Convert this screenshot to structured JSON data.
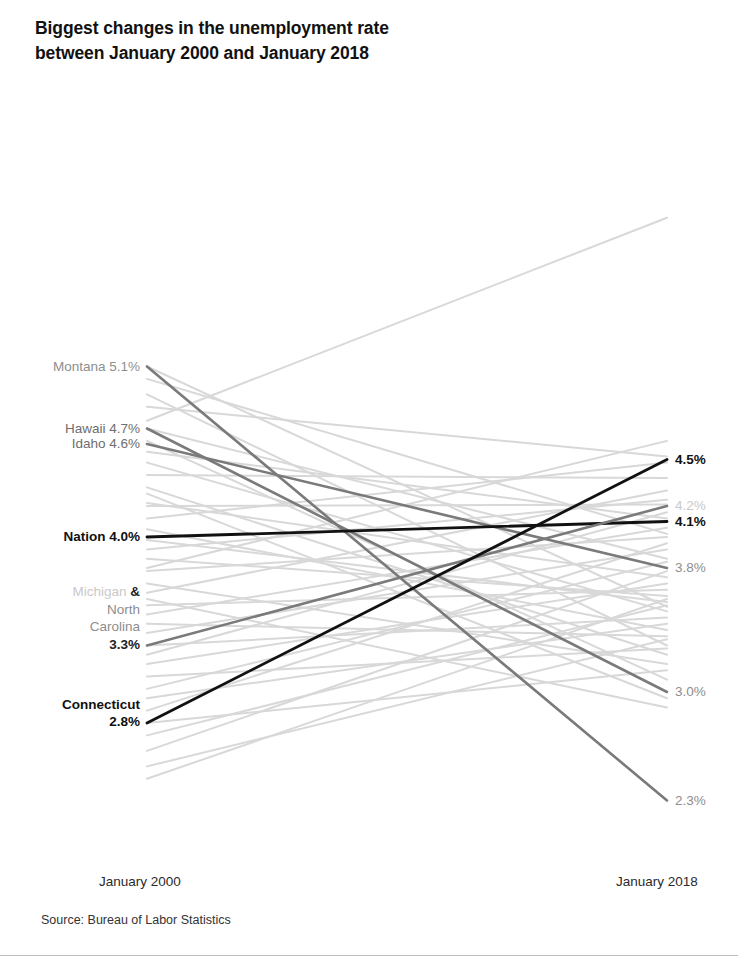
{
  "title": "Biggest changes in the unemployment rate between January 2000 and January 2018",
  "title_line1": "Biggest changes in the unemployment rate",
  "title_line2": "between January 2000 and January 2018",
  "source": "Source: Bureau of Labor Statistics",
  "axis": {
    "left_label": "January 2000",
    "right_label": "January 2018"
  },
  "colors": {
    "background_line": "#d8d8d8",
    "highlight_line": "#7a7a7a",
    "emphasis_line": "#111111",
    "muted_text": "#8e8e8e",
    "faint_text": "#c9c9c9",
    "strong_text": "#111111",
    "rule": "#bdbdbd",
    "page_background": "#ffffff"
  },
  "chart_data": {
    "type": "line",
    "subtype": "slopegraph",
    "title": "Biggest changes in the unemployment rate between January 2000 and January 2018",
    "xlabel": "",
    "ylabel": "Unemployment rate",
    "x": [
      "January 2000",
      "January 2018"
    ],
    "ylim": [
      2.0,
      6.5
    ],
    "grid": false,
    "legend": "none",
    "value_format": "percent",
    "highlighted_series": [
      {
        "name": "Montana",
        "left_label": "Montana 5.1%",
        "right_label": "2.3%",
        "values": [
          5.1,
          2.3
        ],
        "emphasis": "highlight",
        "left_label_style": "mute",
        "right_label_style": "mute"
      },
      {
        "name": "Hawaii",
        "left_label": "Hawaii 4.7%",
        "right_label": "3.0%",
        "values": [
          4.7,
          3.0
        ],
        "emphasis": "highlight",
        "left_label_style": "mid",
        "right_label_style": "mute"
      },
      {
        "name": "Idaho",
        "left_label": "Idaho 4.6%",
        "right_label": "3.8%",
        "values": [
          4.6,
          3.8
        ],
        "emphasis": "highlight",
        "left_label_style": "mid",
        "right_label_style": "mute"
      },
      {
        "name": "Nation",
        "left_label": "Nation 4.0%",
        "right_label": "4.1%",
        "values": [
          4.0,
          4.1
        ],
        "emphasis": "emphasis",
        "left_label_style": "strong",
        "right_label_style": "strong"
      },
      {
        "name": "Michigan & North Carolina",
        "left_label_lines": [
          "Michigan &",
          "North",
          "Carolina",
          "3.3%"
        ],
        "right_label": "4.2%",
        "values": [
          3.3,
          4.2
        ],
        "emphasis": "highlight",
        "left_label_style": "mixed",
        "right_label_style": "faint"
      },
      {
        "name": "Connecticut",
        "left_label_lines": [
          "Connecticut",
          "2.8%"
        ],
        "right_label": "4.5%",
        "values": [
          2.8,
          4.5
        ],
        "emphasis": "emphasis",
        "left_label_style": "strong",
        "right_label_style": "strong"
      }
    ],
    "background_series": [
      {
        "name": "bg-01",
        "values": [
          4.75,
          6.06
        ]
      },
      {
        "name": "bg-02",
        "values": [
          4.2,
          4.21
        ]
      },
      {
        "name": "bg-03",
        "values": [
          3.98,
          3.58
        ]
      },
      {
        "name": "bg-04",
        "values": [
          3.8,
          4.62
        ]
      },
      {
        "name": "bg-05",
        "values": [
          5.1,
          3.55
        ]
      },
      {
        "name": "bg-06",
        "values": [
          5.02,
          4.02
        ]
      },
      {
        "name": "bg-07",
        "values": [
          4.92,
          3.3
        ]
      },
      {
        "name": "bg-08",
        "values": [
          4.7,
          3.86
        ]
      },
      {
        "name": "bg-09",
        "values": [
          4.62,
          3.08
        ]
      },
      {
        "name": "bg-10",
        "values": [
          4.55,
          4.12
        ]
      },
      {
        "name": "bg-11",
        "values": [
          4.48,
          3.52
        ]
      },
      {
        "name": "bg-12",
        "values": [
          4.4,
          4.38
        ]
      },
      {
        "name": "bg-13",
        "values": [
          4.32,
          3.24
        ]
      },
      {
        "name": "bg-14",
        "values": [
          4.22,
          3.74
        ]
      },
      {
        "name": "bg-15",
        "values": [
          4.12,
          4.48
        ]
      },
      {
        "name": "bg-16",
        "values": [
          4.05,
          3.4
        ]
      },
      {
        "name": "bg-17",
        "values": [
          3.92,
          4.24
        ]
      },
      {
        "name": "bg-18",
        "values": [
          3.86,
          3.62
        ]
      },
      {
        "name": "bg-19",
        "values": [
          3.78,
          4.0
        ]
      },
      {
        "name": "bg-20",
        "values": [
          3.7,
          3.18
        ]
      },
      {
        "name": "bg-21",
        "values": [
          3.64,
          4.3
        ]
      },
      {
        "name": "bg-22",
        "values": [
          3.56,
          3.66
        ]
      },
      {
        "name": "bg-23",
        "values": [
          3.5,
          4.06
        ]
      },
      {
        "name": "bg-24",
        "values": [
          3.44,
          3.36
        ]
      },
      {
        "name": "bg-25",
        "values": [
          3.38,
          3.92
        ]
      },
      {
        "name": "bg-26",
        "values": [
          3.3,
          3.48
        ]
      },
      {
        "name": "bg-27",
        "values": [
          3.24,
          4.16
        ]
      },
      {
        "name": "bg-28",
        "values": [
          3.18,
          3.7
        ]
      },
      {
        "name": "bg-29",
        "values": [
          3.1,
          3.28
        ]
      },
      {
        "name": "bg-30",
        "values": [
          3.02,
          3.84
        ]
      },
      {
        "name": "bg-31",
        "values": [
          2.96,
          3.44
        ]
      },
      {
        "name": "bg-32",
        "values": [
          2.88,
          3.96
        ]
      },
      {
        "name": "bg-33",
        "values": [
          2.8,
          3.14
        ]
      },
      {
        "name": "bg-34",
        "values": [
          2.72,
          3.56
        ]
      },
      {
        "name": "bg-35",
        "values": [
          2.62,
          3.78
        ]
      },
      {
        "name": "bg-36",
        "values": [
          2.52,
          3.34
        ]
      },
      {
        "name": "bg-37",
        "values": [
          4.84,
          4.52
        ]
      },
      {
        "name": "bg-38",
        "values": [
          4.28,
          2.96
        ]
      },
      {
        "name": "bg-39",
        "values": [
          3.6,
          2.9
        ]
      },
      {
        "name": "bg-40",
        "values": [
          2.44,
          3.6
        ]
      }
    ]
  }
}
